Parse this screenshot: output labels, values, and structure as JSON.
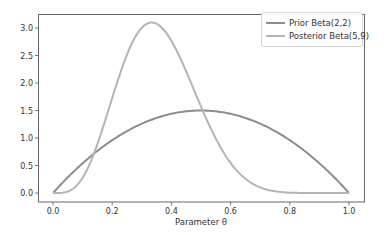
{
  "chart_data": {
    "type": "line",
    "title": "",
    "xlabel": "Parameter θ",
    "ylabel": "",
    "xlim": [
      0.0,
      1.0
    ],
    "ylim": [
      0.0,
      3.1
    ],
    "x_ticks": [
      "0.0",
      "0.2",
      "0.4",
      "0.6",
      "0.8",
      "1.0"
    ],
    "y_ticks": [
      "0.0",
      "0.5",
      "1.0",
      "1.5",
      "2.0",
      "2.5",
      "3.0"
    ],
    "grid": false,
    "legend_position": "upper right",
    "x": [
      0.0,
      0.05,
      0.1,
      0.15,
      0.2,
      0.25,
      0.3,
      0.333,
      0.35,
      0.4,
      0.45,
      0.5,
      0.55,
      0.6,
      0.65,
      0.7,
      0.75,
      0.8,
      0.85,
      0.9,
      0.95,
      1.0
    ],
    "series": [
      {
        "name": "Prior Beta(2,2)",
        "color": "#8c8c8c",
        "values": [
          0.0,
          0.285,
          0.54,
          0.765,
          0.96,
          1.125,
          1.26,
          1.333,
          1.365,
          1.44,
          1.485,
          1.5,
          1.485,
          1.44,
          1.365,
          1.26,
          1.125,
          0.96,
          0.765,
          0.54,
          0.285,
          0.0
        ]
      },
      {
        "name": "Posterior Beta(5,9)",
        "color": "#b4b4b4",
        "values": [
          0.0,
          0.027,
          0.28,
          0.89,
          1.72,
          2.48,
          2.97,
          3.1,
          3.08,
          2.86,
          2.35,
          1.73,
          1.14,
          0.67,
          0.34,
          0.15,
          0.055,
          0.016,
          0.003,
          0.0,
          0.0,
          0.0
        ]
      }
    ]
  },
  "legend": {
    "items": [
      {
        "label": "Prior Beta(2,2)",
        "color": "#8c8c8c"
      },
      {
        "label": "Posterior Beta(5,9)",
        "color": "#b4b4b4"
      }
    ]
  },
  "axes": {
    "xlabel": "Parameter θ"
  }
}
